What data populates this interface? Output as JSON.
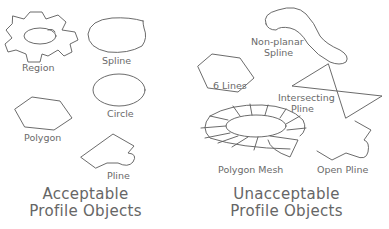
{
  "figure": {
    "left_panel": {
      "title_line1": "Acceptable",
      "title_line2": "Profile Objects",
      "objects": [
        {
          "name": "region",
          "label": "Region"
        },
        {
          "name": "spline",
          "label": "Spline"
        },
        {
          "name": "circle",
          "label": "Circle"
        },
        {
          "name": "polygon",
          "label": "Polygon"
        },
        {
          "name": "pline",
          "label": "Pline"
        }
      ]
    },
    "right_panel": {
      "title_line1": "Unacceptable",
      "title_line2": "Profile Objects",
      "objects": [
        {
          "name": "non-planar-spline",
          "label_line1": "Non-planar",
          "label_line2": "Spline"
        },
        {
          "name": "six-lines",
          "label": "6  Lines"
        },
        {
          "name": "intersecting-pline",
          "label_line1": "Intersecting",
          "label_line2": "Pline"
        },
        {
          "name": "polygon-mesh",
          "label": "Polygon  Mesh"
        },
        {
          "name": "open-pline",
          "label": "Open  Pline"
        }
      ]
    },
    "colors": {
      "stroke": "#5a5a5a",
      "text": "#6a6a6a",
      "background": "#ffffff"
    }
  }
}
